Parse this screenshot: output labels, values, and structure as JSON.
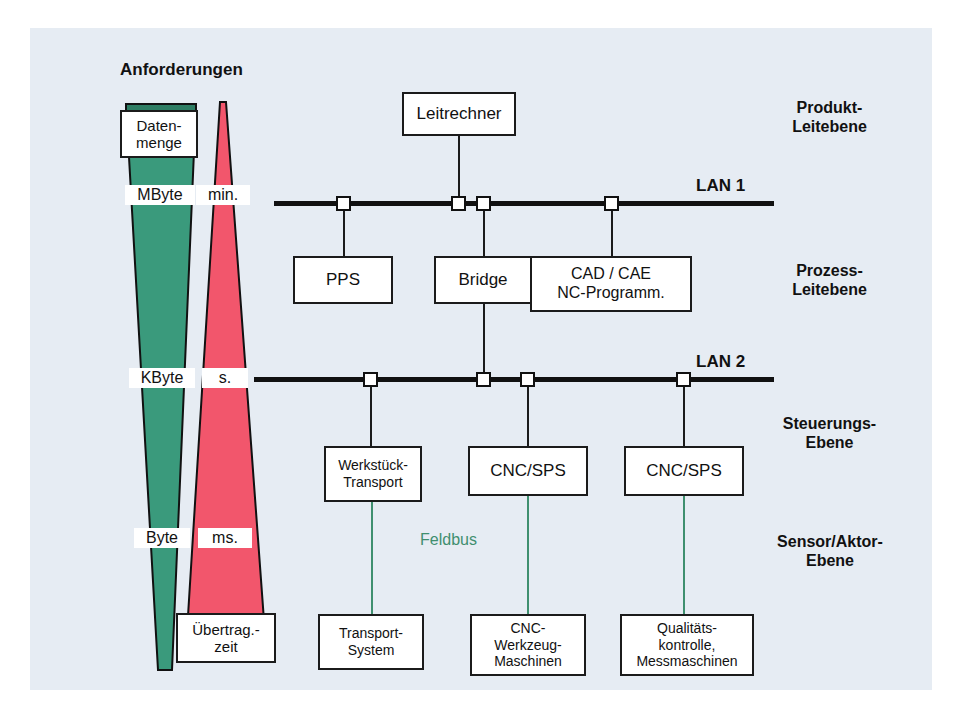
{
  "diagram": {
    "title": "Anforderungen",
    "background_color": "#e6ecf3",
    "green_color": "#3a9a7c",
    "green_dark_color": "#2e7d63",
    "pink_color": "#f2566c",
    "pink_dark_color": "#c0334a",
    "feldbus_label": "Feldbus",
    "feldbus_color": "#3f8f6f"
  },
  "wedges": {
    "data_volume": {
      "cap_label": "Daten-\nmenge",
      "scale_labels": [
        "MByte",
        "KByte",
        "Byte"
      ]
    },
    "transfer_time": {
      "cap_label": "Übertrag.-\nzeit",
      "scale_labels": [
        "min.",
        "s.",
        "ms."
      ]
    }
  },
  "buses": [
    {
      "name": "LAN 1"
    },
    {
      "name": "LAN 2"
    }
  ],
  "levels": [
    {
      "label": "Produkt-\nLeitebene"
    },
    {
      "label": "Prozess-\nLeitebene"
    },
    {
      "label": "Steuerungs-\nEbene"
    },
    {
      "label": "Sensor/Aktor-\nEbene"
    }
  ],
  "nodes": {
    "leitrechner": "Leitrechner",
    "pps": "PPS",
    "bridge": "Bridge",
    "cad_cae": "CAD / CAE\nNC-Programm.",
    "werkstueck_transport": "Werkstück-\nTransport",
    "cnc_sps_1": "CNC/SPS",
    "cnc_sps_2": "CNC/SPS",
    "transport_system": "Transport-\nSystem",
    "cnc_werkzeug": "CNC-\nWerkzeug-\nMaschinen",
    "qualitaets": "Qualitäts-\nkontrolle,\nMessmaschinen"
  }
}
